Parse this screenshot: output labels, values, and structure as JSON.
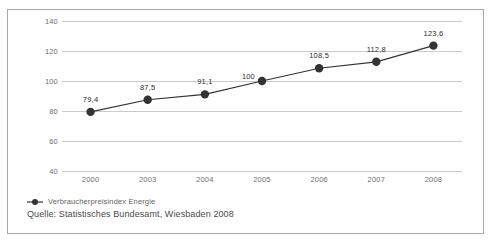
{
  "chart_data": {
    "type": "line",
    "title": "",
    "xlabel": "",
    "ylabel": "",
    "categories": [
      "2000",
      "2003",
      "2004",
      "2005",
      "2006",
      "2007",
      "2008"
    ],
    "series": [
      {
        "name": "Verbraucherpreisindex Energie",
        "values": [
          79.4,
          87.5,
          91.1,
          100,
          108.5,
          112.8,
          123.6
        ],
        "value_labels": [
          "79,4",
          "87,5",
          "91,1",
          "100",
          "108,5",
          "112,8",
          "123,6"
        ],
        "color": "#333333",
        "marker": "circle"
      }
    ],
    "ylim": [
      40,
      140
    ],
    "yticks": [
      140,
      120,
      100,
      80,
      60,
      40
    ],
    "ytick_labels": [
      "140",
      "120",
      "100",
      "80",
      "60",
      "40"
    ],
    "grid": true,
    "grid_color": "#c9c9c9",
    "legend_position": "bottom-left"
  },
  "legend": {
    "entries": [
      {
        "label": "Verbraucherpreisindex Energie"
      }
    ]
  },
  "footer": {
    "source": "Quelle: Statistisches Bundesamt, Wiesbaden 2008"
  }
}
